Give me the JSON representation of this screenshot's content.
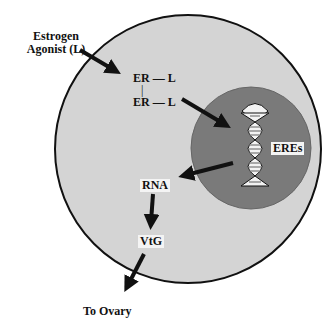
{
  "labels": {
    "agonist_line1": "Estrogen",
    "agonist_line2": "Agonist (L)",
    "er_l_top": "ER — L",
    "er_l_bottom": "ER — L",
    "bond": "|",
    "eres": "EREs",
    "rna": "RNA",
    "vtg": "VtG",
    "to_ovary": "To Ovary"
  },
  "colors": {
    "cell_fill": "#d4d4d4",
    "cell_stroke": "#111111",
    "nucleus_fill": "#7a7a7a",
    "arrow": "#111111",
    "background": "#ffffff"
  }
}
